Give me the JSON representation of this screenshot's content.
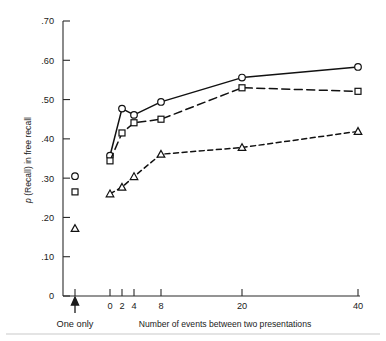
{
  "chart_data": {
    "type": "line",
    "title": "",
    "xlabel": "Number of events between two presentations",
    "ylabel": "p (Recall) in free recall",
    "ylabel_italic_prefix": "p",
    "ylabel_rest": " (Recall) in free recall",
    "x": [
      0,
      2,
      4,
      8,
      20,
      40
    ],
    "xtick_labels": [
      "0",
      "2",
      "4",
      "8",
      "20",
      "40"
    ],
    "ytick_labels": [
      ".70",
      ".60",
      ".50",
      ".40",
      ".30",
      ".20",
      ".10",
      "0"
    ],
    "ytick_values": [
      0.7,
      0.6,
      0.5,
      0.4,
      0.3,
      0.2,
      0.1,
      0
    ],
    "ylim": [
      0,
      0.7
    ],
    "grid": false,
    "legend": "none",
    "series": [
      {
        "name": "circle-series",
        "marker": "circle",
        "linestyle": "solid",
        "values": [
          0.357,
          0.477,
          0.461,
          0.494,
          0.556,
          0.583
        ]
      },
      {
        "name": "square-series",
        "marker": "square",
        "linestyle": "long-dash",
        "values": [
          0.344,
          0.415,
          0.441,
          0.45,
          0.53,
          0.521
        ]
      },
      {
        "name": "triangle-series",
        "marker": "triangle",
        "linestyle": "short-dash",
        "values": [
          0.26,
          0.277,
          0.304,
          0.361,
          0.378,
          0.419
        ]
      }
    ],
    "one_only": {
      "label": "One only",
      "annotation_icon": "up-arrow",
      "points": [
        {
          "marker": "circle",
          "value": 0.305
        },
        {
          "marker": "square",
          "value": 0.265
        },
        {
          "marker": "triangle",
          "value": 0.172
        }
      ]
    }
  }
}
